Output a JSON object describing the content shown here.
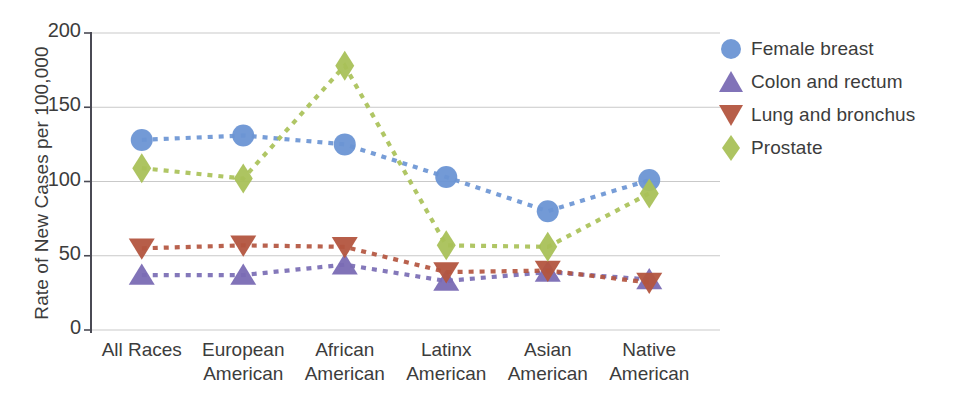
{
  "chart_data": {
    "type": "line",
    "title": "",
    "subtitle": "",
    "xlabel": "",
    "ylabel": "Rate of New Cases per 100,000",
    "ylim": [
      0,
      200
    ],
    "yticks": [
      0,
      50,
      100,
      150,
      200
    ],
    "ytick_labels": [
      "0",
      "50",
      "100",
      "150",
      "200"
    ],
    "grid": "horizontal",
    "legend_position": "right",
    "line_style": "dotted",
    "categories": [
      "All Races",
      "European American",
      "African American",
      "Latinx American",
      "Asian American",
      "Native American"
    ],
    "category_lines": [
      [
        "All Races"
      ],
      [
        "European",
        "American"
      ],
      [
        "African",
        "American"
      ],
      [
        "Latinx",
        "American"
      ],
      [
        "Asian",
        "American"
      ],
      [
        "Native",
        "American"
      ]
    ],
    "series": [
      {
        "name": "Female breast",
        "marker": "circle",
        "color": "#6b95d4",
        "values": [
          128,
          131,
          125,
          103,
          80,
          101
        ]
      },
      {
        "name": "Colon and rectum",
        "marker": "triangle-up",
        "color": "#7a6cb4",
        "values": [
          37,
          37,
          44,
          33,
          39,
          34
        ]
      },
      {
        "name": "Lung and bronchus",
        "marker": "triangle-down",
        "color": "#b3553f",
        "values": [
          55,
          57,
          56,
          39,
          40,
          32
        ]
      },
      {
        "name": "Prostate",
        "marker": "diamond",
        "color": "#a9c158",
        "values": [
          109,
          102,
          178,
          57,
          56,
          92
        ]
      }
    ]
  },
  "legend": {
    "items": [
      {
        "label": "Female breast",
        "marker": "circle-marker-icon",
        "color": "#6b95d4"
      },
      {
        "label": "Colon and rectum",
        "marker": "triangle-up-marker-icon",
        "color": "#7a6cb4"
      },
      {
        "label": "Lung and bronchus",
        "marker": "triangle-down-marker-icon",
        "color": "#b3553f"
      },
      {
        "label": "Prostate",
        "marker": "diamond-marker-icon",
        "color": "#a9c158"
      }
    ]
  },
  "axes": {
    "y_axis_label": "Rate of New Cases per 100,000",
    "y_tick_labels": [
      "200",
      "150",
      "100",
      "50",
      "0"
    ]
  }
}
